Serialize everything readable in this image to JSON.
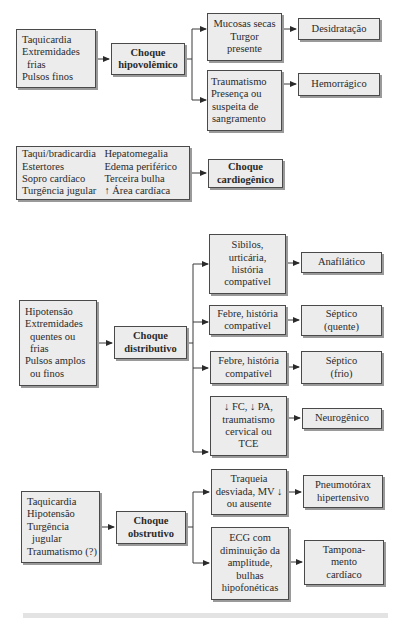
{
  "hypovolemic": {
    "symptoms": [
      "Taquicardia",
      "Extremidades",
      "frias",
      "Pulsos finos"
    ],
    "shock": [
      "Choque",
      "hipovolêmico"
    ],
    "branches": [
      {
        "findings": [
          "Mucosas secas",
          "Turgor",
          "presente"
        ],
        "result": [
          "Desidratação"
        ]
      },
      {
        "findings": [
          "Traumatismo",
          "Presença ou",
          "suspeita de",
          "sangramento"
        ],
        "result": [
          "Hemorrágico"
        ]
      }
    ]
  },
  "cardiogenic": {
    "symptoms_col1": [
      "Taqui/bradicardia",
      "Estertores",
      "Sopro cardíaco",
      "Turgência jugular"
    ],
    "symptoms_col2": [
      "Hepatomegalia",
      "Edema periférico",
      "Terceira bulha",
      "↑ Área cardíaca"
    ],
    "shock": [
      "Choque",
      "cardiogênico"
    ]
  },
  "distributive": {
    "symptoms": [
      "Hipotensão",
      "Extremidades",
      "quentes ou",
      "frias",
      "Pulsos amplos",
      "ou finos"
    ],
    "shock": [
      "Choque",
      "distributivo"
    ],
    "branches": [
      {
        "findings": [
          "Sibilos,",
          "urticária,",
          "história",
          "compatível"
        ],
        "result": [
          "Anafilático"
        ]
      },
      {
        "findings": [
          "Febre, história",
          "compatível"
        ],
        "result": [
          "Séptico",
          "(quente)"
        ]
      },
      {
        "findings": [
          "Febre, história",
          "compatível"
        ],
        "result": [
          "Séptico",
          "(frio)"
        ]
      },
      {
        "findings": [
          "↓ FC, ↓ PA,",
          "traumatismo",
          "cervical ou",
          "TCE"
        ],
        "result": [
          "Neurogênico"
        ]
      }
    ]
  },
  "obstructive": {
    "symptoms": [
      "Taquicardia",
      "Hipotensão",
      "Turgência",
      "jugular",
      "Traumatismo (?)"
    ],
    "shock": [
      "Choque",
      "obstrutivo"
    ],
    "branches": [
      {
        "findings": [
          "Traqueia",
          "desviada, MV ↓",
          "ou ausente"
        ],
        "result": [
          "Pneumotórax",
          "hipertensivo"
        ]
      },
      {
        "findings": [
          "ECG com",
          "diminuição da",
          "amplitude,",
          "bulhas",
          "hipofonéticas"
        ],
        "result": [
          "Tampona-",
          "mento",
          "cardíaco"
        ]
      }
    ]
  },
  "colors": {
    "box_fill": "#ececec",
    "box_border": "#4a4a4a",
    "box_shadow": "#9a9a9a",
    "line": "#3a3a3a"
  }
}
